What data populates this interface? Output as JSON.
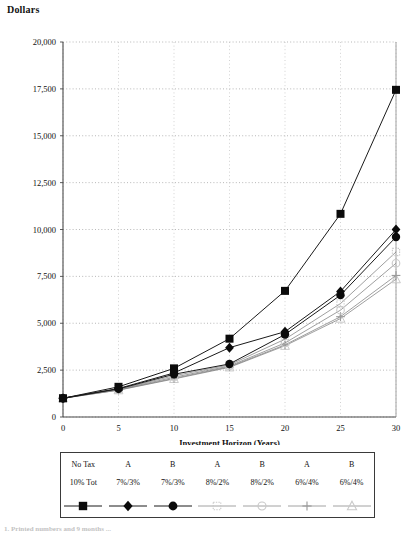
{
  "chart_title": "Dollars",
  "axis": {
    "xlabel": "Investment Horizon (Years)",
    "ylabel": "Dollars",
    "xticks": [
      "0",
      "5",
      "10",
      "15",
      "20",
      "25",
      "30"
    ],
    "yticks": [
      "0",
      "2,500",
      "5,000",
      "7,500",
      "10,000",
      "12,500",
      "15,000",
      "17,500",
      "20,000"
    ]
  },
  "footer_note": "1. Printed numbers and 9 months ...",
  "legend": {
    "row1": [
      "No Tax",
      "A",
      "B",
      "A",
      "B",
      "A",
      "B"
    ],
    "row2": [
      "10% Tot",
      "7%/3%",
      "7%/3%",
      "8%/2%",
      "8%/2%",
      "6%/4%",
      "6%/4%"
    ],
    "markers": [
      "filled-square",
      "filled-diamond",
      "filled-circle",
      "faint-square",
      "open-circle",
      "plus-cross",
      "open-triangle"
    ]
  },
  "chart_data": {
    "type": "line",
    "title": "Dollars",
    "xlabel": "Investment Horizon (Years)",
    "ylabel": "Dollars",
    "xlim": [
      0,
      30
    ],
    "ylim": [
      0,
      20000
    ],
    "xtick_step": 5,
    "ytick_step": 2500,
    "grid": true,
    "legend_position": "bottom",
    "x": [
      0,
      5,
      10,
      15,
      20,
      25,
      30
    ],
    "series": [
      {
        "name": "No Tax 10% Tot",
        "marker": "filled-square",
        "values": [
          1000,
          1610,
          2594,
          4177,
          6727,
          10835,
          17449
        ]
      },
      {
        "name": "A 7%/3%",
        "marker": "filled-diamond",
        "values": [
          1000,
          1520,
          2350,
          3700,
          4550,
          6700,
          10000
        ]
      },
      {
        "name": "B 7%/3%",
        "marker": "filled-circle",
        "values": [
          1000,
          1500,
          2280,
          2830,
          4400,
          6500,
          9600
        ]
      },
      {
        "name": "A 8%/2%",
        "marker": "faint-square",
        "values": [
          1000,
          1480,
          2200,
          2780,
          4150,
          6050,
          8800
        ]
      },
      {
        "name": "B 8%/2%",
        "marker": "open-circle",
        "values": [
          1000,
          1460,
          2120,
          2720,
          3950,
          5700,
          8200
        ]
      },
      {
        "name": "A 6%/4%",
        "marker": "plus-cross",
        "values": [
          1000,
          1440,
          2060,
          2680,
          3850,
          5350,
          7550
        ]
      },
      {
        "name": "B 6%/4%",
        "marker": "open-triangle",
        "values": [
          1000,
          1430,
          2030,
          2650,
          3800,
          5250,
          7350
        ]
      }
    ]
  }
}
